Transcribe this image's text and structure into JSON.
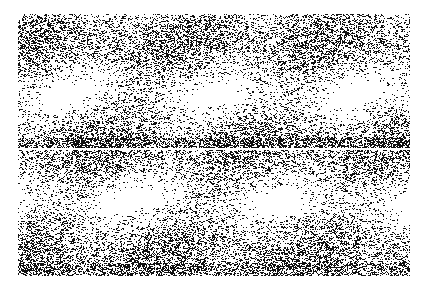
{
  "image": {
    "description": "Black-and-white speckled noise texture on white background",
    "width": 429,
    "height": 287,
    "noise_region": {
      "x": 18,
      "y": 14,
      "width": 392,
      "height": 262
    },
    "split_line_y": 143,
    "colors": {
      "background": "#ffffff",
      "ink": "#111111"
    }
  }
}
